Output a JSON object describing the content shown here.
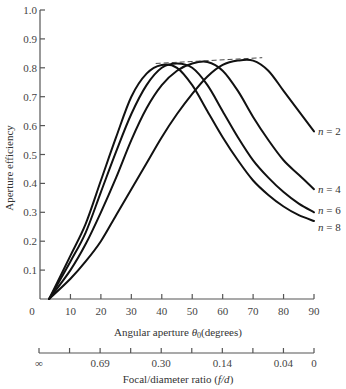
{
  "chart_data": {
    "type": "line",
    "title": "",
    "xlabel": "Angular aperture θ0 (degrees)",
    "ylabel": "Aperture efficiency",
    "xlim": [
      0,
      90
    ],
    "ylim": [
      0,
      1.0
    ],
    "grid": false,
    "legend": "inline labels at right end of curves",
    "x_ticks": [
      0,
      10,
      20,
      30,
      40,
      50,
      60,
      70,
      80,
      90
    ],
    "y_ticks": [
      0.1,
      0.2,
      0.3,
      0.4,
      0.5,
      0.6,
      0.7,
      0.8,
      0.9,
      1.0
    ],
    "y_tick_labels": [
      "0.1",
      "0.2",
      "0.3",
      "0.4",
      "0.5",
      "0.6",
      "0.7",
      "0.8",
      "0.9",
      "1.0"
    ],
    "x": [
      3,
      10,
      15,
      20,
      25,
      30,
      35,
      40,
      45,
      50,
      55,
      60,
      65,
      70,
      75,
      80,
      85,
      90
    ],
    "series": [
      {
        "name": "n = 2",
        "values": [
          0.0,
          0.07,
          0.13,
          0.2,
          0.29,
          0.38,
          0.47,
          0.56,
          0.64,
          0.71,
          0.77,
          0.81,
          0.825,
          0.825,
          0.79,
          0.72,
          0.65,
          0.58
        ]
      },
      {
        "name": "n = 4",
        "values": [
          0.0,
          0.1,
          0.19,
          0.3,
          0.42,
          0.55,
          0.66,
          0.74,
          0.79,
          0.815,
          0.82,
          0.79,
          0.72,
          0.63,
          0.55,
          0.48,
          0.43,
          0.38
        ]
      },
      {
        "name": "n = 6",
        "values": [
          0.0,
          0.13,
          0.23,
          0.37,
          0.51,
          0.64,
          0.74,
          0.8,
          0.815,
          0.8,
          0.74,
          0.65,
          0.56,
          0.48,
          0.42,
          0.37,
          0.33,
          0.3
        ]
      },
      {
        "name": "n = 8",
        "values": [
          0.0,
          0.15,
          0.26,
          0.41,
          0.56,
          0.7,
          0.78,
          0.81,
          0.8,
          0.74,
          0.65,
          0.56,
          0.48,
          0.41,
          0.36,
          0.32,
          0.29,
          0.27
        ]
      }
    ],
    "annotations": [
      "dashed envelope line across peaks at ≈0.82"
    ],
    "secondary_axis": {
      "label": "Focal/diameter ratio (f/d)",
      "tick_positions_deg": [
        0,
        10,
        20,
        30,
        40,
        50,
        60,
        70,
        80,
        90
      ],
      "labels": [
        {
          "deg": 0,
          "text": "∞"
        },
        {
          "deg": 20,
          "text": "0.69"
        },
        {
          "deg": 40,
          "text": "0.30"
        },
        {
          "deg": 60,
          "text": "0.14"
        },
        {
          "deg": 80,
          "text": "0.04"
        },
        {
          "deg": 90,
          "text": "0"
        }
      ]
    }
  },
  "axes": {
    "y_title": "Aperture efficiency",
    "x_title_main": "Angular aperture ",
    "x_title_theta": "θ",
    "x_title_sub": "0",
    "x_title_unit": "(degrees)",
    "x_origin_label": "0",
    "f_title": "Focal/diameter ratio (",
    "f_title_var": "f/d",
    "f_title_end": ")"
  }
}
